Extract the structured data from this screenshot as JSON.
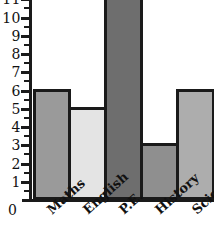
{
  "chart_data": {
    "type": "bar",
    "title": "",
    "xlabel": "",
    "ylabel": "",
    "categories": [
      "Maths",
      "English",
      "P.E.",
      "History",
      "Science"
    ],
    "values": [
      6,
      5,
      11,
      3,
      6
    ],
    "bar_colors": [
      "#9a9a9a",
      "#e4e4e4",
      "#6e6e6e",
      "#8f8f8f",
      "#adadad"
    ],
    "bar_border_color": "#1a1a1a",
    "ylim": [
      0,
      11
    ],
    "ytick_labels": [
      "0",
      "1",
      "2",
      "3",
      "4",
      "5",
      "6",
      "7",
      "8",
      "9",
      "10",
      "11"
    ],
    "ytick_values": [
      0,
      1,
      2,
      3,
      4,
      5,
      6,
      7,
      8,
      9,
      10,
      11
    ],
    "minor_ticks": true,
    "grid": false,
    "legend": null,
    "axis_color": "#1a1a1a",
    "background_color": "#ffffff",
    "note": "P.E. bar is clipped by the top edge of the image"
  },
  "axis": {
    "zero_label": "0"
  }
}
